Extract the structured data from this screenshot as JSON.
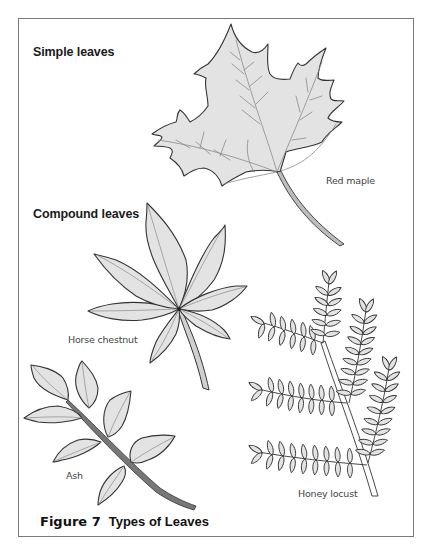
{
  "figure": {
    "number_label": "Figure 7",
    "title": "Types of Leaves"
  },
  "sections": {
    "simple": {
      "heading": "Simple leaves"
    },
    "compound": {
      "heading": "Compound leaves"
    }
  },
  "leaves": [
    {
      "name": "Red maple",
      "category": "simple"
    },
    {
      "name": "Horse chestnut",
      "category": "compound"
    },
    {
      "name": "Ash",
      "category": "compound"
    },
    {
      "name": "Honey locust",
      "category": "compound"
    }
  ],
  "colors": {
    "leaf_fill": "#e3e3e3",
    "leaf_outline": "#333333",
    "vein": "#8a8a8a",
    "frame_border": "#7a7a7a"
  }
}
